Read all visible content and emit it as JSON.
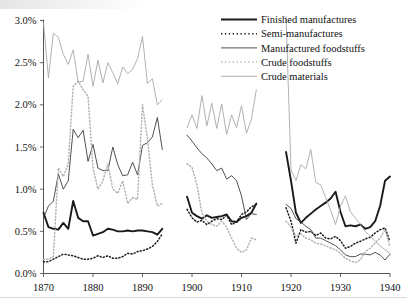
{
  "chart_data": {
    "type": "line",
    "title": "",
    "xlabel": "",
    "ylabel": "",
    "xlim": [
      1870,
      1940
    ],
    "ylim": [
      0.0,
      3.0
    ],
    "ytick_labels": [
      "0.0%",
      "0.5%",
      "1.0%",
      "1.5%",
      "2.0%",
      "2.5%",
      "3.0%"
    ],
    "ytick_values": [
      0.0,
      0.5,
      1.0,
      1.5,
      2.0,
      2.5,
      3.0
    ],
    "xtick_labels": [
      "1870",
      "1880",
      "1890",
      "1900",
      "1910",
      "1920",
      "1930",
      "1940"
    ],
    "xtick_values": [
      1870,
      1880,
      1890,
      1900,
      1910,
      1920,
      1930,
      1940
    ],
    "grid": false,
    "legend_position": "top-right",
    "units": "percent",
    "segments_note": "Three disjoint eras: 1870-1894, 1899-1913, 1919-1940",
    "series": [
      {
        "name": "Finished manufactures",
        "color": "#1a1a1a",
        "style": "solid",
        "width": 1.9,
        "segments": [
          {
            "x": [
              1870,
              1871,
              1872,
              1873,
              1874,
              1875,
              1876,
              1877,
              1878,
              1879,
              1880,
              1881,
              1882,
              1883,
              1884,
              1885,
              1886,
              1887,
              1888,
              1889,
              1890,
              1891,
              1892,
              1893,
              1894
            ],
            "y": [
              0.72,
              0.55,
              0.53,
              0.52,
              0.6,
              0.53,
              0.86,
              0.66,
              0.62,
              0.62,
              0.45,
              0.47,
              0.49,
              0.53,
              0.52,
              0.5,
              0.5,
              0.51,
              0.5,
              0.51,
              0.51,
              0.5,
              0.49,
              0.46,
              0.53
            ]
          },
          {
            "x": [
              1899,
              1900,
              1901,
              1902,
              1903,
              1904,
              1905,
              1906,
              1907,
              1908,
              1909,
              1910,
              1911,
              1912,
              1913
            ],
            "y": [
              0.91,
              0.72,
              0.68,
              0.65,
              0.69,
              0.66,
              0.67,
              0.68,
              0.7,
              0.62,
              0.61,
              0.66,
              0.68,
              0.72,
              0.83
            ]
          },
          {
            "x": [
              1919,
              1920,
              1921,
              1922,
              1923,
              1924,
              1925,
              1926,
              1927,
              1928,
              1929,
              1930,
              1931,
              1932,
              1933,
              1934,
              1935,
              1936,
              1937,
              1938,
              1939,
              1940
            ],
            "y": [
              1.44,
              1.1,
              0.72,
              0.6,
              0.66,
              0.71,
              0.76,
              0.8,
              0.84,
              0.89,
              0.97,
              0.73,
              0.56,
              0.57,
              0.56,
              0.58,
              0.53,
              0.55,
              0.62,
              0.8,
              1.1,
              1.15
            ]
          }
        ]
      },
      {
        "name": "Semi-manufactures",
        "color": "#1a1a1a",
        "style": "dotted",
        "width": 1.5,
        "segments": [
          {
            "x": [
              1870,
              1871,
              1872,
              1873,
              1874,
              1875,
              1876,
              1877,
              1878,
              1879,
              1880,
              1881,
              1882,
              1883,
              1884,
              1885,
              1886,
              1887,
              1888,
              1889,
              1890,
              1891,
              1892,
              1893,
              1894
            ],
            "y": [
              0.14,
              0.14,
              0.17,
              0.2,
              0.23,
              0.22,
              0.21,
              0.19,
              0.17,
              0.17,
              0.18,
              0.21,
              0.19,
              0.21,
              0.18,
              0.18,
              0.2,
              0.24,
              0.23,
              0.26,
              0.27,
              0.29,
              0.32,
              0.38,
              0.47
            ]
          },
          {
            "x": [
              1899,
              1900,
              1901,
              1902,
              1903,
              1904,
              1905,
              1906,
              1907,
              1908,
              1909,
              1910,
              1911,
              1912,
              1913
            ],
            "y": [
              0.76,
              0.66,
              0.61,
              0.63,
              0.58,
              0.62,
              0.65,
              0.64,
              0.69,
              0.58,
              0.61,
              0.7,
              0.73,
              0.79,
              0.82
            ]
          },
          {
            "x": [
              1919,
              1920,
              1921,
              1922,
              1923,
              1924,
              1925,
              1926,
              1927,
              1928,
              1929,
              1930,
              1931,
              1932,
              1933,
              1934,
              1935,
              1936,
              1937,
              1938,
              1939,
              1940
            ],
            "y": [
              0.78,
              0.62,
              0.36,
              0.52,
              0.49,
              0.5,
              0.45,
              0.48,
              0.42,
              0.41,
              0.44,
              0.39,
              0.3,
              0.32,
              0.36,
              0.38,
              0.41,
              0.43,
              0.48,
              0.52,
              0.54,
              0.38
            ]
          }
        ]
      },
      {
        "name": "Manufactured foodstuffs",
        "color": "#3d3d3d",
        "style": "solid",
        "width": 0.9,
        "segments": [
          {
            "x": [
              1870,
              1871,
              1872,
              1873,
              1874,
              1875,
              1876,
              1877,
              1878,
              1879,
              1880,
              1881,
              1882,
              1883,
              1884,
              1885,
              1886,
              1887,
              1888,
              1889,
              1890,
              1891,
              1892,
              1893,
              1894
            ],
            "y": [
              0.66,
              0.8,
              0.86,
              1.18,
              1.0,
              1.1,
              1.71,
              1.61,
              1.7,
              1.33,
              1.53,
              1.25,
              1.22,
              1.22,
              1.5,
              1.29,
              1.16,
              1.17,
              1.32,
              1.17,
              1.52,
              1.55,
              1.62,
              1.85,
              1.47
            ]
          },
          {
            "x": [
              1899,
              1900,
              1901,
              1902,
              1903,
              1904,
              1905,
              1906,
              1907,
              1908,
              1909,
              1910,
              1911,
              1912,
              1913
            ],
            "y": [
              1.64,
              1.57,
              1.49,
              1.42,
              1.37,
              1.3,
              1.22,
              1.25,
              1.12,
              1.16,
              1.1,
              0.92,
              0.64,
              0.71,
              0.7
            ]
          },
          {
            "x": [
              1919,
              1920,
              1921,
              1922,
              1923,
              1924,
              1925,
              1926,
              1927,
              1928,
              1929,
              1930,
              1931,
              1932,
              1933,
              1934,
              1935,
              1936,
              1937,
              1938,
              1939,
              1940
            ],
            "y": [
              0.82,
              0.77,
              0.65,
              0.61,
              0.56,
              0.52,
              0.42,
              0.42,
              0.39,
              0.36,
              0.33,
              0.28,
              0.22,
              0.2,
              0.2,
              0.23,
              0.23,
              0.22,
              0.25,
              0.22,
              0.16,
              0.23
            ]
          }
        ]
      },
      {
        "name": "Crude foodstuffs",
        "color": "#b3b3b3",
        "style": "dotted",
        "width": 1.5,
        "segments": [
          {
            "x": [
              1870,
              1871,
              1872,
              1873,
              1874,
              1875,
              1876,
              1877,
              1878,
              1879,
              1880,
              1881,
              1882,
              1883,
              1884,
              1885,
              1886,
              1887,
              1888,
              1889,
              1890,
              1891,
              1892,
              1893,
              1894
            ],
            "y": [
              0.17,
              0.17,
              0.2,
              1.25,
              1.15,
              1.3,
              2.22,
              2.28,
              2.18,
              2.1,
              1.25,
              1.0,
              1.1,
              1.3,
              1.0,
              0.95,
              1.1,
              0.83,
              0.9,
              0.88,
              2.0,
              1.6,
              1.05,
              0.8,
              0.83
            ]
          },
          {
            "x": [
              1899,
              1900,
              1901,
              1902,
              1903,
              1904,
              1905,
              1906,
              1907,
              1908,
              1909,
              1910,
              1911,
              1912,
              1913
            ],
            "y": [
              1.3,
              1.26,
              1.05,
              0.72,
              0.62,
              0.58,
              0.56,
              0.62,
              0.55,
              0.42,
              0.3,
              0.25,
              0.28,
              0.42,
              0.4
            ]
          },
          {
            "x": [
              1919,
              1920,
              1921,
              1922,
              1923,
              1924,
              1925,
              1926,
              1927,
              1928,
              1929,
              1930,
              1931,
              1932,
              1933,
              1934,
              1935,
              1936,
              1937,
              1938,
              1939,
              1940
            ],
            "y": [
              0.62,
              0.55,
              0.44,
              0.47,
              0.42,
              0.4,
              0.36,
              0.35,
              0.33,
              0.3,
              0.28,
              0.24,
              0.18,
              0.15,
              0.13,
              0.16,
              0.26,
              0.3,
              0.36,
              0.42,
              0.52,
              0.32
            ]
          }
        ]
      },
      {
        "name": "Crude materials",
        "color": "#a8a8a8",
        "style": "solid",
        "width": 0.9,
        "segments": [
          {
            "x": [
              1870,
              1871,
              1872,
              1873,
              1874,
              1875,
              1876,
              1877,
              1878,
              1879,
              1880,
              1881,
              1882,
              1883,
              1884,
              1885,
              1886,
              1887,
              1888,
              1889,
              1890,
              1891,
              1892,
              1893,
              1894
            ],
            "y": [
              2.97,
              2.32,
              2.85,
              2.8,
              2.6,
              2.48,
              2.65,
              2.27,
              2.28,
              2.6,
              2.22,
              2.53,
              2.26,
              2.5,
              2.38,
              2.25,
              2.45,
              2.37,
              2.42,
              2.55,
              2.81,
              2.25,
              2.31,
              2.0,
              2.06
            ]
          },
          {
            "x": [
              1899,
              1900,
              1901,
              1902,
              1903,
              1904,
              1905,
              1906,
              1907,
              1908,
              1909,
              1910,
              1911,
              1912,
              1913
            ],
            "y": [
              1.73,
              1.88,
              1.72,
              2.11,
              1.75,
              2.02,
              1.72,
              2.01,
              1.65,
              1.88,
              1.73,
              1.99,
              1.66,
              1.83,
              2.18
            ]
          },
          {
            "x": [
              1919,
              1920,
              1921,
              1922,
              1923,
              1924,
              1925,
              1926,
              1927,
              1928,
              1929,
              1930,
              1931,
              1932,
              1933,
              1934,
              1935,
              1936,
              1937,
              1938,
              1939,
              1940
            ],
            "y": [
              3.05,
              1.23,
              1.1,
              1.29,
              1.24,
              1.47,
              1.08,
              1.05,
              0.9,
              0.75,
              0.58,
              0.8,
              0.92,
              0.73,
              0.66,
              0.58,
              0.5,
              0.44,
              0.38,
              0.33,
              0.28,
              0.24
            ]
          }
        ]
      }
    ]
  },
  "axes": {
    "y_axis_name": "y-axis",
    "x_axis_name": "x-axis"
  },
  "legend": {
    "entries": [
      {
        "label": "Finished manufactures"
      },
      {
        "label": "Semi-manufactures"
      },
      {
        "label": "Manufactured foodstuffs"
      },
      {
        "label": "Crude foodstuffs"
      },
      {
        "label": "Crude materials"
      }
    ]
  }
}
